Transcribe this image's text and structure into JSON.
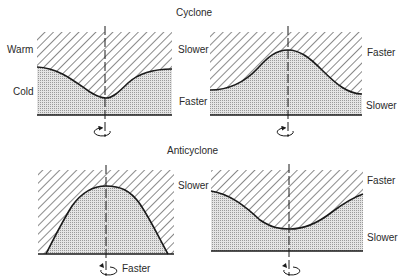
{
  "titles": {
    "cyclone": "Cyclone",
    "anticyclone": "Anticyclone"
  },
  "panels": [
    {
      "id": "cyclone-left",
      "shape": "trough",
      "labels": {
        "left_upper": "Warm",
        "left_lower": "Cold",
        "right_upper": "Slower",
        "right_lower": "Faster"
      },
      "rotation": "counterclockwise"
    },
    {
      "id": "cyclone-right",
      "shape": "ridge",
      "labels": {
        "right_upper": "Faster",
        "right_lower": "Slower"
      },
      "rotation": "counterclockwise"
    },
    {
      "id": "anticyclone-left",
      "shape": "dome",
      "labels": {
        "right_upper": "Slower",
        "bottom": "Faster"
      },
      "rotation": "clockwise"
    },
    {
      "id": "anticyclone-right",
      "shape": "trough",
      "labels": {
        "right_upper": "Faster",
        "right_lower": "Slower"
      },
      "rotation": "clockwise"
    }
  ],
  "legend": {
    "hatched": "Warm",
    "stippled": "Cold"
  },
  "colors": {
    "line": "#1a1a1a",
    "hatch": "#3a3a3a",
    "stipple": "#cfcfcf"
  }
}
